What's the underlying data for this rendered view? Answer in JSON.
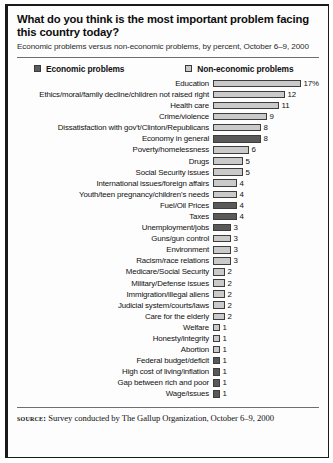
{
  "figure": {
    "title": "What do you think is the most important problem facing this country today?",
    "subtitle": "Economic problems versus non-economic problems, by percent, October 6–9, 2000",
    "source_label": "source:",
    "source_text": "Survey conducted by The Gallup Organization, October 6–9, 2000"
  },
  "legend": {
    "items": [
      {
        "label": "Economic problems",
        "key": "economic",
        "color": "#595959"
      },
      {
        "label": "Non-economic problems",
        "key": "non-economic",
        "color": "#cacaca"
      }
    ]
  },
  "chart_data": {
    "type": "bar",
    "orientation": "horizontal",
    "title": "What do you think is the most important problem facing this country today?",
    "subtitle": "Economic problems versus non-economic problems, by percent, October 6–9, 2000",
    "xlabel": "",
    "ylabel": "",
    "xlim": [
      0,
      17
    ],
    "grid": false,
    "legend_position": "top",
    "unit": "percent",
    "series": [
      {
        "name": "Economic problems",
        "color": "#595959"
      },
      {
        "name": "Non-economic problems",
        "color": "#cacaca"
      }
    ],
    "categories": [
      "Education",
      "Ethics/moral/family decline/children not raised right",
      "Health care",
      "Crime/violence",
      "Dissatisfaction with gov't/Clinton/Republicans",
      "Economy in general",
      "Poverty/homelessness",
      "Drugs",
      "Social Security issues",
      "International issues/foreign affairs",
      "Youth/teen pregnancy/children's needs",
      "Fuel/Oil Prices",
      "Taxes",
      "Unemployment/jobs",
      "Guns/gun control",
      "Environment",
      "Racism/race relations",
      "Medicare/Social Security",
      "Military/Defense issues",
      "Immigration/illegal aliens",
      "Judicial system/courts/laws",
      "Care for the elderly",
      "Welfare",
      "Honesty/integrity",
      "Abortion",
      "Federal budget/deficit",
      "High cost of living/inflation",
      "Gap between rich and poor",
      "Wage/issues"
    ],
    "values": [
      17,
      12,
      11,
      9,
      8,
      8,
      6,
      5,
      5,
      4,
      4,
      4,
      4,
      3,
      3,
      3,
      3,
      2,
      2,
      2,
      2,
      2,
      1,
      1,
      1,
      1,
      1,
      1,
      1
    ],
    "value_labels": [
      "17%",
      "12",
      "11",
      "9",
      "8",
      "8",
      "6",
      "5",
      "5",
      "4",
      "4",
      "4",
      "4",
      "3",
      "3",
      "3",
      "3",
      "2",
      "2",
      "2",
      "2",
      "2",
      "1",
      "1",
      "1",
      "1",
      "1",
      "1",
      "1"
    ],
    "groups": [
      "non-economic",
      "non-economic",
      "non-economic",
      "non-economic",
      "non-economic",
      "economic",
      "non-economic",
      "non-economic",
      "non-economic",
      "non-economic",
      "non-economic",
      "economic",
      "economic",
      "economic",
      "non-economic",
      "non-economic",
      "non-economic",
      "non-economic",
      "non-economic",
      "non-economic",
      "non-economic",
      "non-economic",
      "non-economic",
      "non-economic",
      "non-economic",
      "economic",
      "economic",
      "economic",
      "economic"
    ]
  }
}
